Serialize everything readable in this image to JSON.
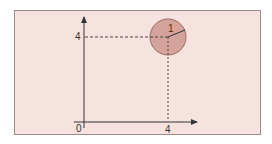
{
  "diagram": {
    "origin_label": "0",
    "x_tick_label": "4",
    "y_tick_label": "4",
    "radius_label": "1",
    "point": {
      "x": 4,
      "y": 4
    },
    "circle_radius": 1,
    "colors": {
      "panel_bg": "#f6e3e0",
      "circle_fill": "#d4a39c",
      "circle_stroke": "#9c6a63",
      "axis": "#333333"
    }
  }
}
